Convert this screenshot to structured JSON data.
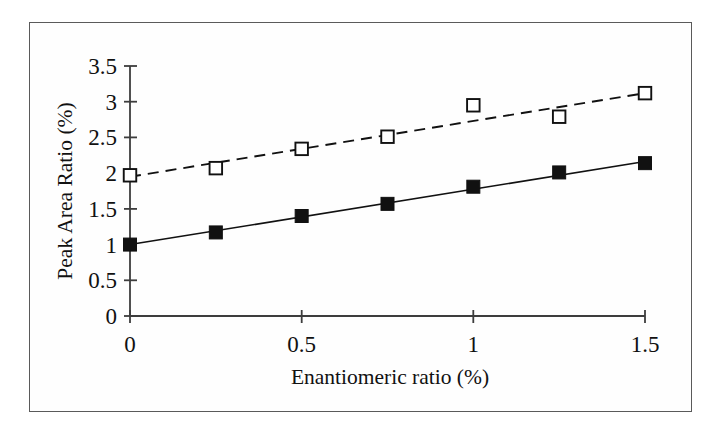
{
  "figure": {
    "background_color": "#ffffff",
    "frame_color": "#5a5a5a",
    "plot_area": {
      "x_left_px": 130,
      "x_right_px": 645,
      "y_bottom_px": 316,
      "y_top_px": 66
    }
  },
  "chart_data": {
    "type": "scatter",
    "title": "",
    "subtitle": "",
    "xlabel": "Enantiomeric ratio (%)",
    "ylabel": "Peak Area Ratio (%)",
    "xlim": [
      0,
      1.5
    ],
    "ylim": [
      0,
      3.5
    ],
    "xticks": [
      0,
      0.5,
      1,
      1.5
    ],
    "xtick_labels": [
      "0",
      "0.5",
      "1",
      "1.5"
    ],
    "yticks": [
      0,
      0.5,
      1,
      1.5,
      2,
      2.5,
      3,
      3.5
    ],
    "ytick_labels": [
      "0",
      "0.5",
      "1",
      "1.5",
      "2",
      "2.5",
      "3",
      "3.5"
    ],
    "grid": false,
    "legend_position": "none",
    "legend_entries": [],
    "annotations": [],
    "x": [
      0,
      0.25,
      0.5,
      0.75,
      1,
      1.25,
      1.5
    ],
    "series": [
      {
        "name": "series-filled-squares",
        "marker": "filled-square",
        "marker_color": "#111111",
        "line_style": "solid",
        "line_color": "#111111",
        "values": [
          1.0,
          1.17,
          1.4,
          1.57,
          1.81,
          2.01,
          2.14
        ],
        "trendline": {
          "intercept": 1.0,
          "slope": 0.775
        }
      },
      {
        "name": "series-open-squares",
        "marker": "open-square",
        "marker_color": "#ffffff",
        "marker_edge_color": "#111111",
        "line_style": "dashed",
        "line_color": "#111111",
        "values": [
          1.97,
          2.07,
          2.34,
          2.51,
          2.95,
          2.79,
          3.12
        ],
        "trendline": {
          "intercept": 1.95,
          "slope": 0.78
        }
      }
    ]
  }
}
